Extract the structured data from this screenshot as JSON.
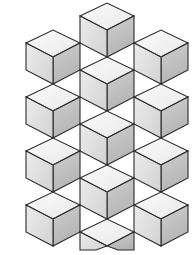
{
  "figure": {
    "name": "rhombille-tiling",
    "width": 196,
    "height": 255,
    "background_color": "#ffffff",
    "stroke_color": "#2b2b2b",
    "stroke_width": 1.1
  },
  "palette": {
    "top_face": "#f2f2f2",
    "left_face": "#e2e2e2",
    "right_face": "#bfbfbf",
    "top_face_label": "light",
    "left_face_label": "medium",
    "right_face_label": "dark"
  },
  "lattice": {
    "origin_x": 80,
    "origin_y": 70,
    "cell_width": 54,
    "cell_height": 54,
    "half_width": 27,
    "quarter_height": 13.5,
    "rhombus_count": 36,
    "cube_count": 12
  },
  "chart_data": {
    "type": "diagram",
    "faces": [
      {
        "id": "f01",
        "shade": "top",
        "points": "80,16 107,3 134,16 107,30"
      },
      {
        "id": "f02",
        "shade": "right",
        "points": "107,30 134,16 134,43 107,57"
      },
      {
        "id": "f03",
        "shade": "left",
        "points": "80,16 107,30 107,57 80,43"
      },
      {
        "id": "f04",
        "shade": "top",
        "points": "26,43 53,30 80,43 53,57"
      },
      {
        "id": "f05",
        "shade": "right",
        "points": "53,57 80,43 80,70 53,84"
      },
      {
        "id": "f06",
        "shade": "left",
        "points": "26,43 53,57 53,84 26,70"
      },
      {
        "id": "f07",
        "shade": "top",
        "points": "134,43 161,30 188,43 161,57"
      },
      {
        "id": "f08",
        "shade": "right",
        "points": "161,57 188,43 188,70 161,84"
      },
      {
        "id": "f09",
        "shade": "left",
        "points": "134,43 161,57 161,84 134,70"
      },
      {
        "id": "f10",
        "shade": "top",
        "points": "80,70 107,57 134,70 107,84"
      },
      {
        "id": "f11",
        "shade": "right",
        "points": "107,84 134,70 134,97 107,111"
      },
      {
        "id": "f12",
        "shade": "left",
        "points": "80,70 107,84 107,111 80,97"
      },
      {
        "id": "f13",
        "shade": "top",
        "points": "26,97 53,84 80,97 53,111"
      },
      {
        "id": "f14",
        "shade": "right",
        "points": "53,111 80,97 80,124 53,138"
      },
      {
        "id": "f15",
        "shade": "left",
        "points": "26,97 53,111 53,138 26,124"
      },
      {
        "id": "f16",
        "shade": "top",
        "points": "134,97 161,84 188,97 161,111"
      },
      {
        "id": "f17",
        "shade": "right",
        "points": "161,111 188,97 188,124 161,138"
      },
      {
        "id": "f18",
        "shade": "left",
        "points": "134,97 161,111 161,138 134,124"
      },
      {
        "id": "f19",
        "shade": "top",
        "points": "80,124 107,111 134,124 107,138"
      },
      {
        "id": "f20",
        "shade": "right",
        "points": "107,138 134,124 134,151 107,165"
      },
      {
        "id": "f21",
        "shade": "left",
        "points": "80,124 107,138 107,165 80,151"
      },
      {
        "id": "f22",
        "shade": "top",
        "points": "26,151 53,138 80,151 53,165"
      },
      {
        "id": "f23",
        "shade": "right",
        "points": "53,165 80,151 80,178 53,192"
      },
      {
        "id": "f24",
        "shade": "left",
        "points": "26,151 53,165 53,192 26,178"
      },
      {
        "id": "f25",
        "shade": "top",
        "points": "134,151 161,138 188,151 161,165"
      },
      {
        "id": "f26",
        "shade": "right",
        "points": "161,165 188,151 188,178 161,192"
      },
      {
        "id": "f27",
        "shade": "left",
        "points": "134,151 161,165 161,192 134,178"
      },
      {
        "id": "f28",
        "shade": "top",
        "points": "80,178 107,165 134,178 107,192"
      },
      {
        "id": "f29",
        "shade": "right",
        "points": "107,192 134,178 134,205 107,219"
      },
      {
        "id": "f30",
        "shade": "left",
        "points": "80,178 107,192 107,219 80,205"
      },
      {
        "id": "f31",
        "shade": "top",
        "points": "26,205 53,192 80,205 53,219"
      },
      {
        "id": "f32",
        "shade": "right",
        "points": "53,219 80,205 80,232 53,246"
      },
      {
        "id": "f33",
        "shade": "left",
        "points": "26,205 53,219 53,246 26,232"
      },
      {
        "id": "f34",
        "shade": "top",
        "points": "134,205 161,192 188,205 161,219"
      },
      {
        "id": "f35",
        "shade": "right",
        "points": "161,219 188,205 188,232 161,246"
      },
      {
        "id": "f36",
        "shade": "left",
        "points": "134,205 161,219 161,246 134,232"
      },
      {
        "id": "f37",
        "shade": "top",
        "points": "80,232 107,219 134,232 107,246"
      },
      {
        "id": "f38",
        "shade": "right",
        "points": "107,246 134,232 134,250 118,250"
      },
      {
        "id": "f39",
        "shade": "left",
        "points": "80,232 107,246 96,250 80,250"
      }
    ]
  }
}
